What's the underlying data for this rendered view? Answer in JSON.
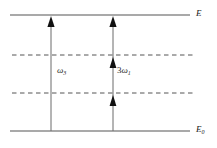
{
  "figure": {
    "type": "energy-level-diagram",
    "title": "",
    "background_color": "#ffffff",
    "line_color": "#555555",
    "arrow_color": "#1a1a1a",
    "text_color": "#1a1a1a",
    "width": 217,
    "height": 148
  },
  "levels": [
    {
      "id": "upper-solid-level",
      "label_base": "E",
      "label_sub": "",
      "style": "solid",
      "y": 15,
      "x_start": 10,
      "x_end": 190,
      "label_x": 196,
      "label_y": 10
    },
    {
      "id": "upper-virtual-level",
      "label_base": "",
      "label_sub": "",
      "style": "dashed",
      "y": 55,
      "x_start": 12,
      "x_end": 195,
      "label_x": 0,
      "label_y": 0
    },
    {
      "id": "lower-virtual-level",
      "label_base": "",
      "label_sub": "",
      "style": "dashed",
      "y": 93,
      "x_start": 12,
      "x_end": 195,
      "label_x": 0,
      "label_y": 0
    },
    {
      "id": "ground-solid-level",
      "label_base": "E",
      "label_sub": "0",
      "style": "solid",
      "y": 131,
      "x_start": 10,
      "x_end": 190,
      "label_x": 196,
      "label_y": 126
    }
  ],
  "transitions": [
    {
      "id": "emission-arrow",
      "x": 51,
      "y_tail": 131,
      "y_head": 17,
      "arrowheads": 1,
      "label_coef": "",
      "label_symbol": "ω",
      "label_sub": "3",
      "label_x": 57,
      "label_y": 67
    },
    {
      "id": "pump-arrow",
      "x": 113,
      "y_tail": 131,
      "y_head": 17,
      "arrowheads": 3,
      "label_coef": "3",
      "label_symbol": "ω",
      "label_sub": "1",
      "label_x": 118,
      "label_y": 67
    }
  ],
  "arrowhead_positions": {
    "emission": [
      17
    ],
    "pump": [
      17,
      59,
      97
    ]
  },
  "labels": {
    "upper_level": "E",
    "ground_level": "E",
    "ground_level_sub": "0",
    "omega_signal": "ω",
    "omega_signal_sub": "3",
    "omega_pump_coef": "3",
    "omega_pump": "ω",
    "omega_pump_sub": "1"
  }
}
